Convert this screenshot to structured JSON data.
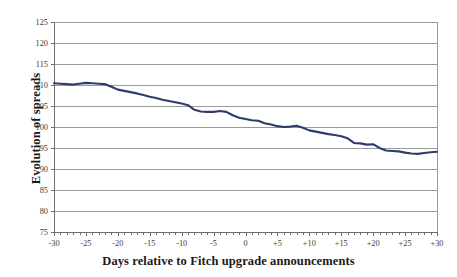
{
  "chart_data": {
    "type": "line",
    "title": "",
    "xlabel": "Days relative to Fitch upgrade announcements",
    "ylabel": "Evolution of spreads",
    "xlim": [
      -30,
      30
    ],
    "ylim": [
      75,
      125
    ],
    "grid": true,
    "legend": false,
    "line_color": "#2f3c6b",
    "axis_color": "#6d6d6d",
    "grid_color": "#9a9a9a",
    "background_color": "#ffffff",
    "y_ticks": [
      75,
      80,
      85,
      90,
      95,
      100,
      105,
      110,
      115,
      120,
      125
    ],
    "y_tick_labels": [
      "75",
      "80",
      "85",
      "90",
      "95",
      "100",
      "105",
      "110",
      "115",
      "120",
      "125"
    ],
    "x_ticks": [
      -30,
      -25,
      -20,
      -15,
      -10,
      -5,
      0,
      5,
      10,
      15,
      20,
      25,
      30
    ],
    "x_tick_labels": [
      "-30",
      "-25",
      "-20",
      "-15",
      "-10",
      "-5",
      "0",
      "+5",
      "+10",
      "+15",
      "+20",
      "+25",
      "+30"
    ],
    "x_minor_tick_interval": 1,
    "series": [
      {
        "name": "Evolution of spreads",
        "color": "#2f3c6b",
        "x": [
          -30,
          -29,
          -28,
          -27,
          -26,
          -25,
          -24,
          -23,
          -22,
          -21,
          -20,
          -19,
          -18,
          -17,
          -16,
          -15,
          -14,
          -13,
          -12,
          -11,
          -10,
          -9,
          -8,
          -7,
          -6,
          -5,
          -4,
          -3,
          -2,
          -1,
          0,
          1,
          2,
          3,
          4,
          5,
          6,
          7,
          8,
          9,
          10,
          11,
          12,
          13,
          14,
          15,
          16,
          17,
          18,
          19,
          20,
          21,
          22,
          23,
          24,
          25,
          26,
          27,
          28,
          29,
          30
        ],
        "values": [
          110.4,
          110.3,
          110.2,
          110.1,
          110.3,
          110.5,
          110.4,
          110.3,
          110.2,
          109.6,
          108.9,
          108.6,
          108.3,
          108.0,
          107.6,
          107.2,
          106.9,
          106.5,
          106.2,
          105.9,
          105.6,
          105.2,
          104.1,
          103.7,
          103.6,
          103.6,
          103.8,
          103.6,
          102.8,
          102.2,
          101.9,
          101.6,
          101.5,
          100.9,
          100.6,
          100.2,
          100.0,
          100.1,
          100.3,
          99.8,
          99.2,
          98.9,
          98.6,
          98.3,
          98.1,
          97.8,
          97.3,
          96.2,
          96.1,
          95.8,
          95.9,
          95.0,
          94.4,
          94.3,
          94.2,
          93.9,
          93.7,
          93.6,
          93.8,
          94.0,
          94.1
        ]
      }
    ]
  }
}
